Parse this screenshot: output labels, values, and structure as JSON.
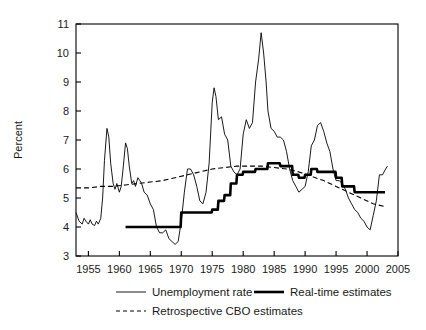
{
  "chart_data": {
    "type": "line",
    "title": "",
    "xlabel": "",
    "ylabel": "Percent",
    "xlim": [
      1953,
      2005
    ],
    "ylim": [
      3,
      11
    ],
    "xticks": [
      1955,
      1960,
      1965,
      1970,
      1975,
      1980,
      1985,
      1990,
      1995,
      2000,
      2005
    ],
    "yticks": [
      3,
      4,
      5,
      6,
      7,
      8,
      9,
      10,
      11
    ],
    "grid": false,
    "legend_position": "bottom",
    "series": [
      {
        "name": "Unemployment rate",
        "style": "thin-solid",
        "color": "#000000",
        "x": [
          1953.0,
          1953.5,
          1954.0,
          1954.3,
          1954.6,
          1955.0,
          1955.3,
          1955.6,
          1956.0,
          1956.3,
          1956.6,
          1957.0,
          1957.3,
          1957.6,
          1958.0,
          1958.3,
          1958.6,
          1959.0,
          1959.3,
          1959.6,
          1960.0,
          1960.3,
          1960.6,
          1961.0,
          1961.3,
          1961.6,
          1962.0,
          1962.3,
          1962.6,
          1963.0,
          1963.3,
          1963.6,
          1964.0,
          1964.5,
          1965.0,
          1965.5,
          1966.0,
          1966.5,
          1967.0,
          1967.5,
          1968.0,
          1968.5,
          1969.0,
          1969.5,
          1970.0,
          1970.5,
          1971.0,
          1971.5,
          1972.0,
          1972.5,
          1973.0,
          1973.5,
          1974.0,
          1974.5,
          1975.0,
          1975.3,
          1975.6,
          1976.0,
          1976.5,
          1977.0,
          1977.5,
          1978.0,
          1978.5,
          1979.0,
          1979.5,
          1980.0,
          1980.5,
          1981.0,
          1981.5,
          1982.0,
          1982.5,
          1982.9,
          1983.3,
          1983.7,
          1984.0,
          1984.5,
          1985.0,
          1985.5,
          1986.0,
          1986.5,
          1987.0,
          1987.5,
          1988.0,
          1988.5,
          1989.0,
          1989.5,
          1990.0,
          1990.5,
          1991.0,
          1991.5,
          1992.0,
          1992.5,
          1993.0,
          1993.5,
          1994.0,
          1994.5,
          1995.0,
          1995.5,
          1996.0,
          1996.5,
          1997.0,
          1997.5,
          1998.0,
          1998.5,
          1999.0,
          1999.5,
          2000.0,
          2000.5,
          2001.0,
          2001.5,
          2002.0,
          2002.5,
          2003.0,
          2003.3
        ],
        "y": [
          4.5,
          4.2,
          4.1,
          4.3,
          4.2,
          4.1,
          4.25,
          4.1,
          4.05,
          4.2,
          4.1,
          4.3,
          5.0,
          6.3,
          7.4,
          7.1,
          6.2,
          5.5,
          5.3,
          5.5,
          5.2,
          5.4,
          6.0,
          6.9,
          6.7,
          6.1,
          5.5,
          5.6,
          5.4,
          5.7,
          5.6,
          5.5,
          5.2,
          5.1,
          4.8,
          4.6,
          4.0,
          3.8,
          3.8,
          3.9,
          3.6,
          3.5,
          3.4,
          3.5,
          4.2,
          5.2,
          6.0,
          6.0,
          5.8,
          5.4,
          4.9,
          4.8,
          5.2,
          6.2,
          8.3,
          8.8,
          8.5,
          7.7,
          7.8,
          7.2,
          7.0,
          6.1,
          5.9,
          5.8,
          6.0,
          7.2,
          7.7,
          7.4,
          7.6,
          9.0,
          9.8,
          10.7,
          10.0,
          9.0,
          8.0,
          7.4,
          7.3,
          7.1,
          7.1,
          7.0,
          6.6,
          6.0,
          5.6,
          5.4,
          5.2,
          5.3,
          5.4,
          5.9,
          6.8,
          7.0,
          7.5,
          7.6,
          7.3,
          6.9,
          6.6,
          6.0,
          5.6,
          5.6,
          5.5,
          5.3,
          5.0,
          4.8,
          4.6,
          4.5,
          4.3,
          4.2,
          4.0,
          3.9,
          4.4,
          4.9,
          5.8,
          5.8,
          6.0,
          6.1
        ],
        "annotations": [
          {
            "label": "1958 recession peak",
            "x": 1958.0,
            "y": 7.4
          },
          {
            "label": "1961 peak",
            "x": 1961.0,
            "y": 6.9
          },
          {
            "label": "late-1960s trough",
            "x": 1969.0,
            "y": 3.4
          },
          {
            "label": "1975 recession peak",
            "x": 1975.3,
            "y": 8.8
          },
          {
            "label": "1982 recession peak",
            "x": 1982.9,
            "y": 10.7
          },
          {
            "label": "1992 peak",
            "x": 1992.5,
            "y": 7.6
          },
          {
            "label": "2000 trough",
            "x": 2000.5,
            "y": 3.9
          }
        ]
      },
      {
        "name": "Real-time estimates",
        "style": "thick-solid",
        "color": "#000000",
        "x": [
          1961.0,
          1965.0,
          1969.0,
          1969.9,
          1970.0,
          1974.9,
          1975.0,
          1975.9,
          1976.0,
          1976.9,
          1977.0,
          1977.9,
          1978.0,
          1978.9,
          1979.0,
          1979.9,
          1980.0,
          1981.9,
          1982.0,
          1983.9,
          1984.0,
          1985.9,
          1986.0,
          1987.9,
          1988.0,
          1988.9,
          1989.0,
          1989.9,
          1990.0,
          1990.9,
          1991.0,
          1991.9,
          1992.0,
          1993.9,
          1994.0,
          1994.9,
          1995.0,
          1995.9,
          1996.0,
          1997.9,
          1998.0,
          1998.9,
          1999.0,
          2002.9
        ],
        "y": [
          4.0,
          4.0,
          4.0,
          4.0,
          4.5,
          4.5,
          4.6,
          4.6,
          4.9,
          4.9,
          5.1,
          5.1,
          5.5,
          5.5,
          5.8,
          5.8,
          5.9,
          5.9,
          6.0,
          6.0,
          6.2,
          6.2,
          6.1,
          6.1,
          5.8,
          5.8,
          5.7,
          5.7,
          5.8,
          5.8,
          6.0,
          6.0,
          5.9,
          5.9,
          5.9,
          5.9,
          5.7,
          5.7,
          5.4,
          5.4,
          5.2,
          5.2,
          5.2,
          5.2
        ]
      },
      {
        "name": "Retrospective CBO estimates",
        "style": "dashed",
        "color": "#000000",
        "x": [
          1953,
          1955,
          1957,
          1959,
          1961,
          1963,
          1965,
          1967,
          1969,
          1971,
          1973,
          1975,
          1977,
          1979,
          1981,
          1983,
          1985,
          1987,
          1989,
          1991,
          1993,
          1995,
          1997,
          1999,
          2001,
          2003
        ],
        "y": [
          5.35,
          5.35,
          5.4,
          5.4,
          5.45,
          5.5,
          5.55,
          5.6,
          5.7,
          5.8,
          5.9,
          6.0,
          6.05,
          6.1,
          6.1,
          6.1,
          6.05,
          6.0,
          5.9,
          5.75,
          5.6,
          5.4,
          5.2,
          5.0,
          4.8,
          4.7
        ]
      }
    ],
    "legend": [
      {
        "label": "Unemployment rate",
        "style": "thin-solid"
      },
      {
        "label": "Real-time estimates",
        "style": "thick-solid"
      },
      {
        "label": "Retrospective CBO estimates",
        "style": "dashed"
      }
    ]
  }
}
